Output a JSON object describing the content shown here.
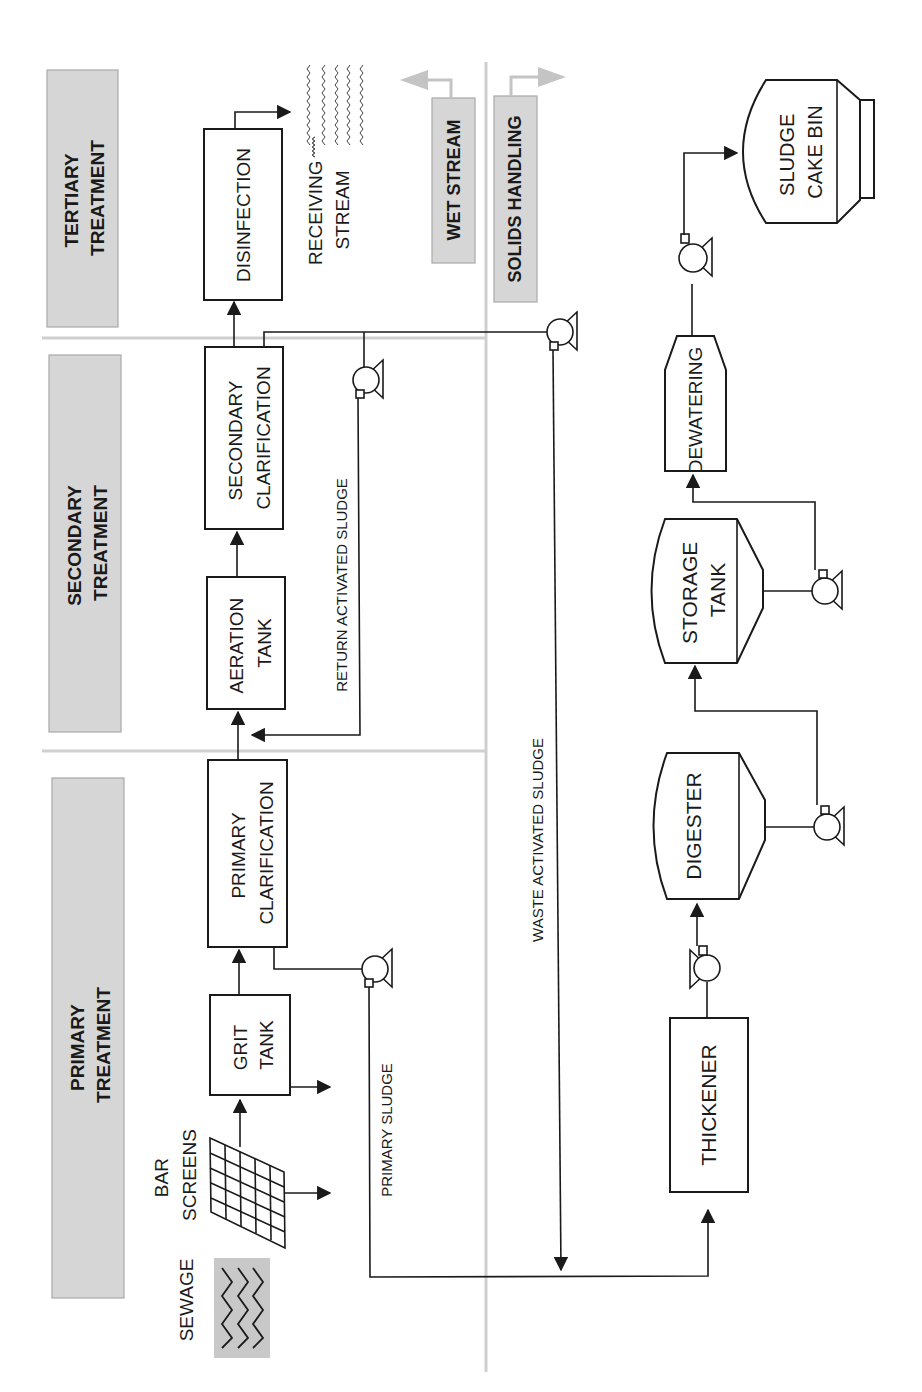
{
  "diagram": {
    "orientation": "rotated 90 degrees counter-clockwise",
    "colors": {
      "header_fill": "#d6d6d6",
      "divider": "#cfcfcf",
      "line": "#1a1a1a",
      "stream_arrow": "#c4c4c4"
    },
    "stage_headers": {
      "primary": {
        "line1": "PRIMARY",
        "line2": "TREATMENT"
      },
      "secondary": {
        "line1": "SECONDARY",
        "line2": "TREATMENT"
      },
      "tertiary": {
        "line1": "TERTIARY",
        "line2": "TREATMENT"
      }
    },
    "stream_labels": {
      "wet": "WET STREAM",
      "solids": "SOLIDS HANDLING"
    },
    "inputs": {
      "sewage": "SEWAGE",
      "bar_screens_line1": "BAR",
      "bar_screens_line2": "SCREENS"
    },
    "units": {
      "grit_tank": {
        "line1": "GRIT",
        "line2": "TANK"
      },
      "primary_clarification": {
        "line1": "PRIMARY",
        "line2": "CLARIFICATION"
      },
      "aeration_tank": {
        "line1": "AERATION",
        "line2": "TANK"
      },
      "secondary_clarification": {
        "line1": "SECONDARY",
        "line2": "CLARIFICATION"
      },
      "disinfection": {
        "line1": "DISINFECTION"
      },
      "receiving_stream": {
        "line1": "RECEIVING",
        "line2": "STREAM"
      },
      "thickener": {
        "line1": "THICKENER"
      },
      "digester": {
        "line1": "DIGESTER"
      },
      "storage_tank": {
        "line1": "STORAGE",
        "line2": "TANK"
      },
      "dewatering": {
        "line1": "DEWATERING"
      },
      "sludge_cake_bin": {
        "line1": "SLUDGE",
        "line2": "CAKE BIN"
      }
    },
    "flow_labels": {
      "primary_sludge": "PRIMARY SLUDGE",
      "return_activated_sludge": "RETURN ACTIVATED SLUDGE",
      "waste_activated_sludge": "WASTE ACTIVATED SLUDGE"
    }
  }
}
